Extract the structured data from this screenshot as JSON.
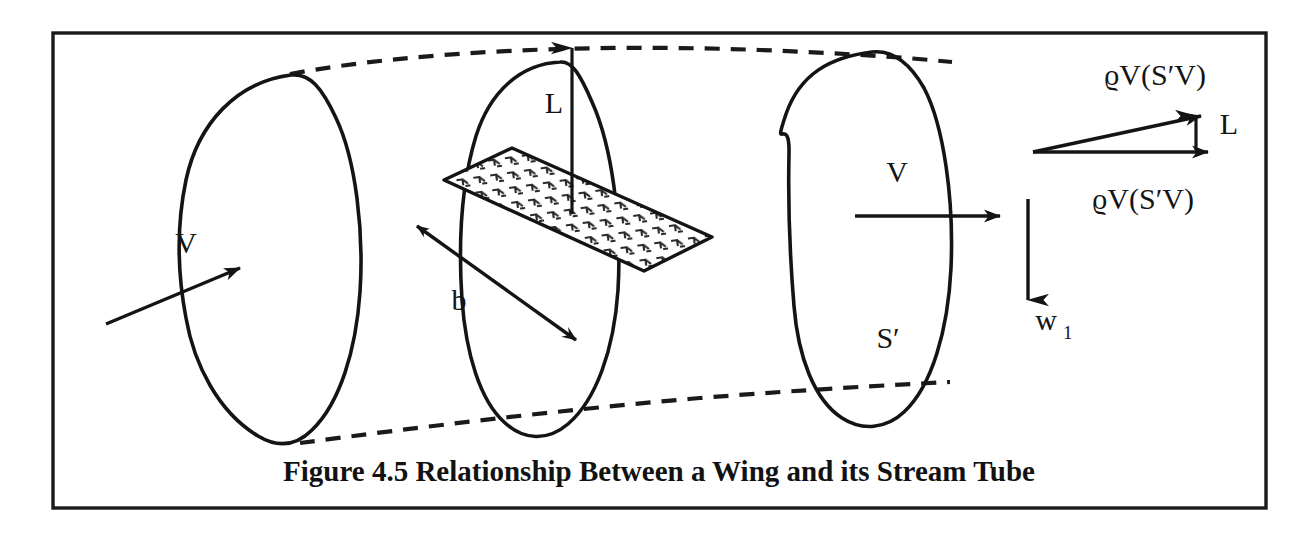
{
  "figure": {
    "caption": "Figure 4.5 Relationship Between a Wing and its Stream Tube",
    "border_color": "#1a1a1a",
    "ink_color": "#141414",
    "background_color": "#ffffff"
  },
  "labels": {
    "upstream_velocity": "V",
    "lift_wing": "L",
    "span": "b",
    "downstream_velocity": "V",
    "downstream_area": "S′",
    "downwash": "w",
    "downwash_subscript": "1",
    "momentum_top": "ϱV(S′V)",
    "momentum_bottom": "ϱV(S′V)",
    "lift_vector": "L"
  },
  "icons": {
    "arrow_head": "arrow-head-icon",
    "double_arrow": "double-arrow-icon",
    "hatch_pattern": "hatch-pattern-icon"
  }
}
